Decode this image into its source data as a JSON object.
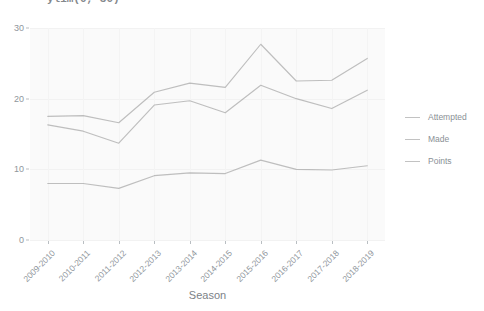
{
  "code_fragment": "ylim(0, 30)",
  "chart_data": {
    "type": "line",
    "title": "",
    "xlabel": "Season",
    "ylabel": "",
    "categories": [
      "2009-2010",
      "2010-2011",
      "2011-2012",
      "2012-2013",
      "2013-2014",
      "2014-2015",
      "2015-2016",
      "2016-2017",
      "2017-2018",
      "2018-2019"
    ],
    "series": [
      {
        "name": "Attempted",
        "color": "#9a9a9a",
        "values": [
          17.5,
          17.6,
          16.6,
          20.9,
          22.2,
          21.6,
          27.7,
          22.5,
          22.6,
          25.7
        ]
      },
      {
        "name": "Made",
        "color": "#9a9a9a",
        "values": [
          16.3,
          15.4,
          13.7,
          19.1,
          19.7,
          18.0,
          21.9,
          20.0,
          18.6,
          21.2
        ]
      },
      {
        "name": "Points",
        "color": "#9a9a9a",
        "values": [
          8.0,
          8.0,
          7.3,
          9.1,
          9.5,
          9.4,
          11.3,
          10.0,
          9.9,
          10.5
        ]
      }
    ],
    "ylim": [
      0,
      30
    ],
    "y_ticks": [
      0,
      10,
      20,
      30
    ],
    "grid": true,
    "legend_position": "right",
    "legend_title": ""
  }
}
